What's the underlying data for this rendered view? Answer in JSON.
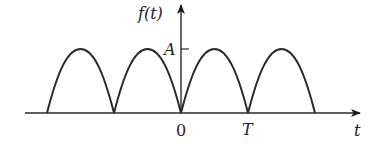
{
  "diagram": {
    "type": "rectified-sine-wave",
    "labels": {
      "y_axis": "f(t)",
      "x_axis": "t",
      "amplitude": "A",
      "origin": "0",
      "period": "T"
    },
    "arch_count": 4,
    "colors": {
      "stroke": "#2a2a2a",
      "background": "#ffffff"
    }
  }
}
